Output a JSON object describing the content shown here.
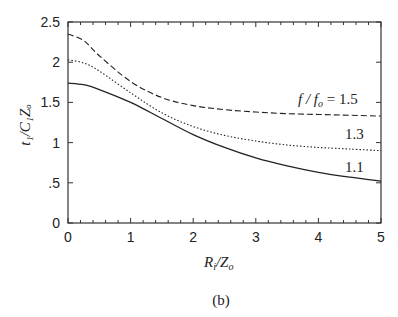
{
  "chart_data": {
    "type": "line",
    "title": "",
    "xlabel": "R_i/Z_o",
    "ylabel": "t_1/C_1 Z_o",
    "xlim": [
      0,
      5
    ],
    "ylim": [
      0,
      2.5
    ],
    "x_ticks": [
      "0",
      "1",
      "2",
      "3",
      "4",
      "5"
    ],
    "y_ticks": [
      "0",
      ".5",
      "1",
      "1.5",
      "2",
      "2.5"
    ],
    "grid": false,
    "legend": "inline curve labels at right",
    "caption": "(b)",
    "x": [
      0,
      0.25,
      0.5,
      1,
      1.5,
      2,
      2.5,
      3,
      3.5,
      4,
      4.5,
      5
    ],
    "series": [
      {
        "name": "f/f_o = 1.5",
        "style": "dashed",
        "values": [
          2.35,
          2.27,
          2.08,
          1.76,
          1.56,
          1.46,
          1.41,
          1.38,
          1.36,
          1.35,
          1.34,
          1.33
        ]
      },
      {
        "name": "1.3",
        "style": "dotted",
        "values": [
          2.03,
          1.99,
          1.89,
          1.62,
          1.37,
          1.2,
          1.09,
          1.02,
          0.97,
          0.94,
          0.92,
          0.9
        ]
      },
      {
        "name": "1.1",
        "style": "solid",
        "values": [
          1.74,
          1.72,
          1.66,
          1.5,
          1.3,
          1.1,
          0.94,
          0.81,
          0.71,
          0.63,
          0.57,
          0.52
        ]
      }
    ]
  },
  "labels": {
    "curve_15_prefix": "f / f",
    "curve_15_sub": "o",
    "curve_15_suffix": " = 1.5",
    "curve_13": "1.3",
    "curve_11": "1.1",
    "xlabel_main": "R",
    "xlabel_sub": "i",
    "xlabel_mid": "/Z",
    "xlabel_sub2": "o",
    "ylabel_text": "t₁/C₁Zₒ",
    "caption": "(b)"
  }
}
